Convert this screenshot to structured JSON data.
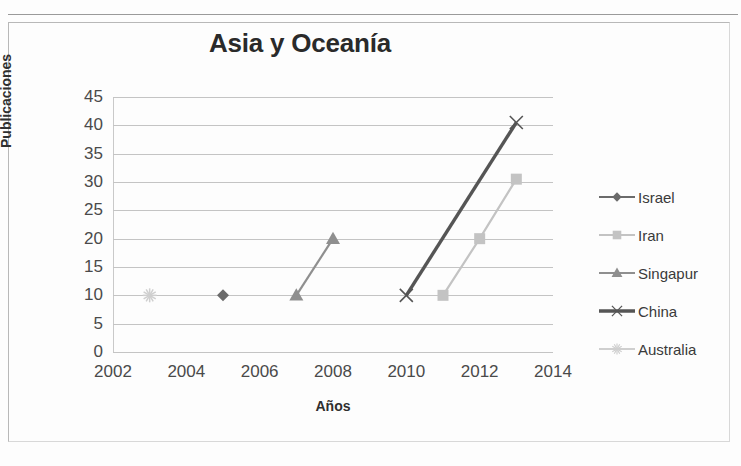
{
  "chart_data": {
    "type": "line",
    "title": "Asia y Oceanía",
    "xlabel": "Años",
    "ylabel": "Publicaciones",
    "xlim": [
      2002,
      2014
    ],
    "ylim": [
      0,
      45
    ],
    "ytick_step": 5,
    "xtick_step": 2,
    "grid": true,
    "legend_position": "right",
    "xticks": [
      "2002",
      "2004",
      "2006",
      "2008",
      "2010",
      "2012",
      "2014"
    ],
    "yticks": [
      "0",
      "5",
      "10",
      "15",
      "20",
      "25",
      "30",
      "35",
      "40",
      "45"
    ],
    "series": [
      {
        "name": "Israel",
        "marker": "diamond",
        "color": "#6b6b6b",
        "x": [
          2005
        ],
        "y": [
          10
        ]
      },
      {
        "name": "Iran",
        "marker": "square",
        "color": "#c3c3c3",
        "x": [
          2011,
          2012,
          2013
        ],
        "y": [
          10,
          20,
          30.5
        ]
      },
      {
        "name": "Singapur",
        "marker": "triangle",
        "color": "#8f8f8f",
        "x": [
          2007,
          2008
        ],
        "y": [
          10,
          20
        ]
      },
      {
        "name": "China",
        "marker": "x",
        "color": "#555555",
        "x": [
          2010,
          2013
        ],
        "y": [
          10,
          40.5
        ]
      },
      {
        "name": "Australia",
        "marker": "star",
        "color": "#cfcfcf",
        "x": [
          2003
        ],
        "y": [
          10
        ]
      }
    ]
  }
}
